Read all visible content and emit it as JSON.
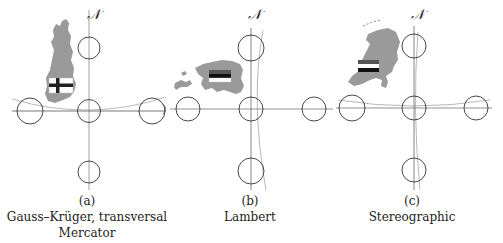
{
  "figure": {
    "north_symbol": "𝒩",
    "panels": [
      {
        "id": "a",
        "tag": "(a)",
        "caption_lines": [
          "Gauss–Krüger, transversal",
          "Mercator"
        ],
        "country": "Finland",
        "flag": "finland-flag"
      },
      {
        "id": "b",
        "tag": "(b)",
        "caption_lines": [
          "Lambert"
        ],
        "country": "Estonia",
        "flag": "estonia-flag"
      },
      {
        "id": "c",
        "tag": "(c)",
        "caption_lines": [
          "Stereographic"
        ],
        "country": "Netherlands",
        "flag": "netherlands-flag"
      }
    ],
    "colors": {
      "land": "#9a9a9a",
      "line": "#555555",
      "circle": "#333333"
    }
  }
}
